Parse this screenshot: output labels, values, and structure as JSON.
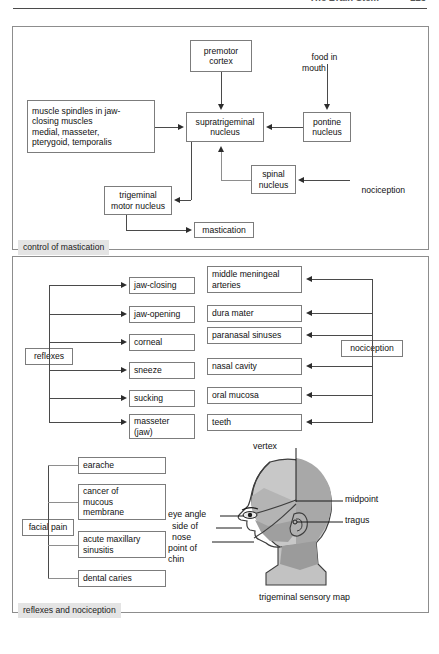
{
  "running_head": {
    "title": "The Brain Stem",
    "page": "223"
  },
  "panel1": {
    "caption": "control of mastication",
    "nodes": {
      "premotor_cortex": "premotor\ncortex",
      "food_in_mouth": "food in\nmouth",
      "muscle_spindles": "muscle spindles in jaw-\nclosing muscles\n   medial, masseter,\n   pterygoid, temporalis",
      "supratrigeminal_nucleus": "supratrigeminal\nnucleus",
      "pontine_nucleus": "pontine\nnucleus",
      "spinal_nucleus": "spinal\nnucleus",
      "nociception": "nociception",
      "trigeminal_motor_nucleus": "trigeminal\nmotor nucleus",
      "mastication": "mastication"
    }
  },
  "panel2": {
    "caption": "reflexes and nociception",
    "reflexes_label": "reflexes",
    "reflexes": [
      "jaw-closing",
      "jaw-opening",
      "corneal",
      "sneeze",
      "sucking",
      "masseter\n(jaw)"
    ],
    "nociception_label": "nociception",
    "nociception_targets": [
      "middle meningeal\narteries",
      "dura mater",
      "paranasal sinuses",
      "nasal cavity",
      "oral mucosa",
      "teeth"
    ],
    "facial_pain_label": "facial pain",
    "facial_pain_causes": [
      "earache",
      "cancer of\nmucous\nmembrane",
      "acute maxillary\nsinusitis",
      "dental caries"
    ],
    "head_figure": {
      "caption": "trigeminal sensory map",
      "labels": {
        "vertex": "vertex",
        "midpoint": "midpoint",
        "tragus": "tragus",
        "eye_angle": "eye angle",
        "side_of_nose": "side of\nnose",
        "point_of_chin": "point of\nchin"
      }
    }
  },
  "colors": {
    "panel_border": "#8d8d8d",
    "caption_bg": "#e4e4e4",
    "box_border": "#7c7c7c",
    "connector": "#4a4a4a",
    "head_light": "#c8c8c8",
    "head_mid": "#a8a8a8",
    "head_dark": "#8f8f8f",
    "head_outline": "#3d3d3d"
  }
}
